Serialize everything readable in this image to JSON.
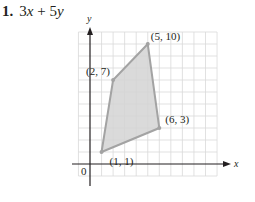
{
  "problem": {
    "number": "1.",
    "expression": "3x + 5y",
    "expression_parts": {
      "c1": "3",
      "v1": "x",
      "op": " + ",
      "c2": "5",
      "v2": "y"
    }
  },
  "graph": {
    "axis_labels": {
      "x": "x",
      "y": "y",
      "origin": "0"
    },
    "grid": {
      "x_min": -1,
      "x_max": 11,
      "y_min": -1,
      "y_max": 11
    },
    "region_fill": "#d4d4d4",
    "edge_color": "#a3a3a3",
    "vertices": [
      {
        "x": 1,
        "y": 1,
        "label": "(1, 1)"
      },
      {
        "x": 6,
        "y": 3,
        "label": "(6, 3)"
      },
      {
        "x": 5,
        "y": 10,
        "label": "(5, 10)"
      },
      {
        "x": 2,
        "y": 7,
        "label": "(2, 7)"
      }
    ]
  }
}
